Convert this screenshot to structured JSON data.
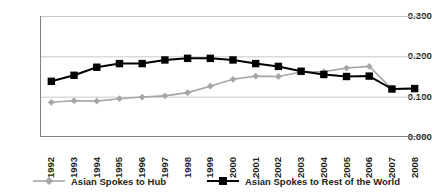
{
  "chart_data": {
    "type": "line",
    "title": "",
    "xlabel": "",
    "ylabel": "",
    "grid": true,
    "legend_position": "bottom",
    "ylim": [
      0.0,
      0.3
    ],
    "yticks": [
      "0.000",
      "0.100",
      "0.200",
      "0.300"
    ],
    "ytick_values": [
      0.0,
      0.1,
      0.2,
      0.3
    ],
    "categories": [
      "1992",
      "1993",
      "1994",
      "1995",
      "1996",
      "1997",
      "1998",
      "1999",
      "2000",
      "2001",
      "2002",
      "2003",
      "2004",
      "2005",
      "2006",
      "2007",
      "2008"
    ],
    "series": [
      {
        "name": "Asian Spokes to Hub",
        "color": "#a6a6a6",
        "marker": "diamond",
        "values": [
          0.086,
          0.09,
          0.089,
          0.095,
          0.099,
          0.102,
          0.11,
          0.126,
          0.143,
          0.151,
          0.15,
          0.161,
          0.162,
          0.171,
          0.175,
          0.119,
          0.121
        ]
      },
      {
        "name": "Asian Spokes to Rest of the World",
        "color": "#000000",
        "marker": "square",
        "values": [
          0.138,
          0.153,
          0.173,
          0.182,
          0.182,
          0.191,
          0.195,
          0.195,
          0.191,
          0.182,
          0.175,
          0.163,
          0.155,
          0.15,
          0.151,
          0.119,
          0.12
        ]
      }
    ]
  },
  "legend": {
    "items": [
      {
        "label": "Asian Spokes to Hub"
      },
      {
        "label": "Asian Spokes to Rest of the World"
      }
    ]
  },
  "colors": {
    "series_hub": "#a6a6a6",
    "series_row": "#000000",
    "gridline": "#c8c8c8",
    "axis": "#808080",
    "text": "#231f20",
    "background": "#ffffff"
  }
}
